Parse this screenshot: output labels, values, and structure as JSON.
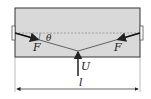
{
  "diagram": {
    "labels": {
      "force_left": "F",
      "force_right": "F",
      "angle": "θ",
      "upward_force": "U",
      "length": "l"
    },
    "colors": {
      "box_fill": "#d9d9d9",
      "stroke": "#333333",
      "dashed": "#888888"
    }
  }
}
